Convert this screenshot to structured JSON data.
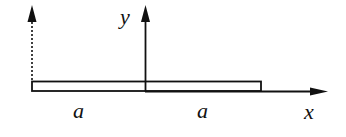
{
  "diagram": {
    "type": "beam-coordinate-sketch",
    "colors": {
      "ink": "#111111",
      "background": "#ffffff"
    },
    "axes": {
      "y_label": "y",
      "x_label": "x"
    },
    "dimensions": {
      "left_segment_label": "a",
      "right_segment_label": "a"
    },
    "elements": [
      {
        "name": "dashed-arrow",
        "style": "dashed",
        "direction": "up"
      },
      {
        "name": "y-axis",
        "style": "solid",
        "direction": "up"
      },
      {
        "name": "x-axis",
        "style": "solid",
        "direction": "right"
      },
      {
        "name": "beam-rectangle",
        "style": "outlined"
      }
    ]
  }
}
